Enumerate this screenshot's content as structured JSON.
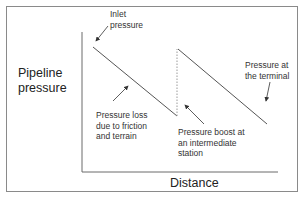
{
  "diagram": {
    "y_axis_label_line1": "Pipeline",
    "y_axis_label_line2": "pressure",
    "x_axis_label": "Distance",
    "annotations": {
      "inlet_line1": "Inlet",
      "inlet_line2": "pressure",
      "terminal_line1": "Pressure at",
      "terminal_line2": "the terminal",
      "loss_line1": "Pressure loss",
      "loss_line2": "due to friction",
      "loss_line3": "and terrain",
      "boost_line1": "Pressure boost at",
      "boost_line2": "an intermediate",
      "boost_line3": "station"
    },
    "colors": {
      "line": "#555555",
      "frame": "#8a8a8a",
      "axis": "#6a6a6a",
      "dashed": "#9a9a9a"
    },
    "segments": [
      {
        "name": "pressure-drop-1",
        "from": [
          93,
          47
        ],
        "to": [
          177,
          116
        ]
      },
      {
        "name": "pressure-boost",
        "from": [
          177,
          116
        ],
        "to": [
          177,
          49
        ],
        "dashed": true
      },
      {
        "name": "pressure-drop-2",
        "from": [
          178,
          49
        ],
        "to": [
          267,
          124
        ]
      }
    ]
  }
}
